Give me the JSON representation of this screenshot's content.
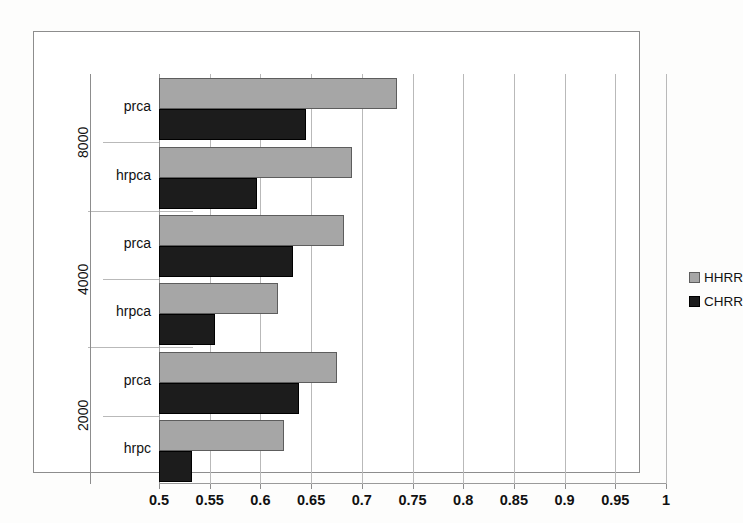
{
  "chart_data": {
    "type": "bar",
    "orientation": "horizontal",
    "title": "",
    "xlabel": "",
    "ylabel": "",
    "xlim": [
      0.5,
      1
    ],
    "xtick_step": 0.05,
    "grid": true,
    "legend_position": "right",
    "groups": [
      {
        "label": "8000",
        "categories": [
          {
            "label": "prca",
            "HHRR": 0.735,
            "CHRR": 0.645
          },
          {
            "label": "hrpca",
            "HHRR": 0.69,
            "CHRR": 0.597
          }
        ]
      },
      {
        "label": "4000",
        "categories": [
          {
            "label": "prca",
            "HHRR": 0.682,
            "CHRR": 0.632
          },
          {
            "label": "hrpca",
            "HHRR": 0.617,
            "CHRR": 0.555
          }
        ]
      },
      {
        "label": "2000",
        "categories": [
          {
            "label": "prca",
            "HHRR": 0.676,
            "CHRR": 0.638
          },
          {
            "label": "hrpc",
            "HHRR": 0.623,
            "CHRR": 0.533
          }
        ]
      }
    ],
    "series": [
      {
        "name": "HHRR",
        "color": "#a6a6a6",
        "values": [
          0.735,
          0.69,
          0.682,
          0.617,
          0.676,
          0.623
        ]
      },
      {
        "name": "CHRR",
        "color": "#1c1c1c",
        "values": [
          0.645,
          0.597,
          0.632,
          0.555,
          0.638,
          0.533
        ]
      }
    ],
    "xtick_labels": [
      "0.5",
      "0.55",
      "0.6",
      "0.65",
      "0.7",
      "0.75",
      "0.8",
      "0.85",
      "0.9",
      "0.95",
      "1"
    ],
    "xtick_values": [
      0.5,
      0.55,
      0.6,
      0.65,
      0.7,
      0.75,
      0.8,
      0.85,
      0.9,
      0.95,
      1.0
    ]
  },
  "legend": {
    "items": [
      {
        "label": "HHRR",
        "color": "#a6a6a6"
      },
      {
        "label": "CHRR",
        "color": "#1c1c1c"
      }
    ]
  }
}
